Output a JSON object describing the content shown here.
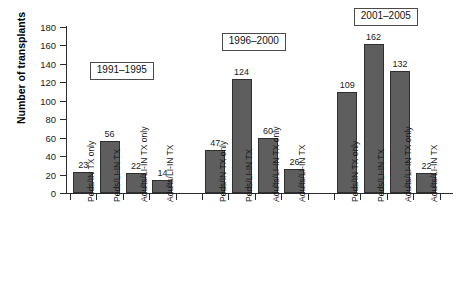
{
  "chart_data": {
    "type": "bar",
    "title": "",
    "xlabel": "",
    "ylabel": "Number of transplants",
    "ylim": [
      0,
      180
    ],
    "ytick_step": 20,
    "yticks": [
      0,
      20,
      40,
      60,
      80,
      100,
      120,
      140,
      160,
      180
    ],
    "grid": false,
    "legend": "none",
    "bar_color": "#5e5e5e",
    "bar_border_color": "#2f2f2f",
    "categories": [
      "Peds/IN TX only",
      "Peds/LI-IN TX",
      "Adults/LI-IN TX only",
      "Adults/LI-IN TX"
    ],
    "groups": [
      {
        "label": "1991–1995",
        "values": [
          23,
          56,
          22,
          14
        ],
        "categories": [
          "Peds/IN TX only",
          "Peds/LI-IN TX",
          "Adults/LI-IN TX only",
          "Adults/LI-IN TX"
        ]
      },
      {
        "label": "1996–2000",
        "values": [
          47,
          124,
          60,
          26
        ],
        "categories": [
          "Peds/IN TX only",
          "Peds/LI-IN TX",
          "Adults/LI-IN TX only",
          "Adults/LI-IN TX"
        ]
      },
      {
        "label": "2001–2005",
        "values": [
          109,
          162,
          132,
          22
        ],
        "categories": [
          "Peds/IN TX only",
          "Peds/LI-IN TX",
          "Adults/LI-IN TX only",
          "Adults/LI-IN TX"
        ]
      }
    ]
  }
}
